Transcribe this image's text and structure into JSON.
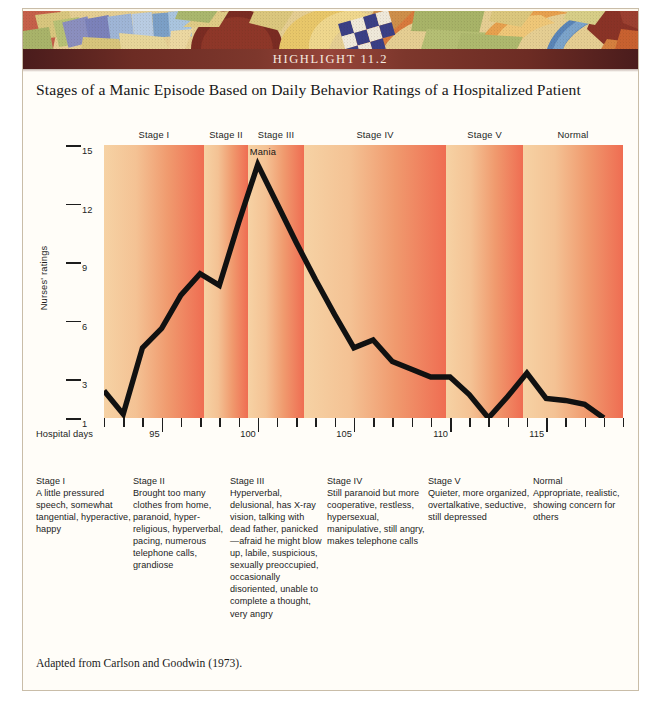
{
  "banner": {
    "label": "HIGHLIGHT 11.2"
  },
  "title": {
    "text": "Stages of a Manic Episode Based on Daily Behavior Ratings of a Hospitalized Patient"
  },
  "footnote": {
    "text": "Adapted from Carlson and Goodwin (1973)."
  },
  "annotations": {
    "mania": "Mania"
  },
  "colors": {
    "banner_dark": "#4a1c1c",
    "banner_mid": "#96453a",
    "band_light": "#f6d2a4",
    "band_dark": "#ef6d52",
    "line": "#111111",
    "frame": "#c9bda8"
  },
  "chart_data": {
    "type": "line",
    "title": "Stages of a Manic Episode Based on Daily Behavior Ratings of a Hospitalized Patient",
    "xlabel": "Hospital days",
    "ylabel": "Nurses' ratings",
    "xlim": [
      92,
      119
    ],
    "ylim": [
      1,
      15
    ],
    "grid": false,
    "legend": null,
    "ytick_labels": [
      "15",
      "12",
      "9",
      "6",
      "3",
      "1"
    ],
    "yticks": [
      15,
      12,
      9,
      6,
      3,
      1
    ],
    "xtick_labels": [
      "95",
      "100",
      "105",
      "110",
      "115"
    ],
    "xticks_major": [
      95,
      100,
      105,
      110,
      115
    ],
    "xticks_all": [
      92,
      93,
      94,
      95,
      96,
      97,
      98,
      99,
      100,
      101,
      102,
      103,
      104,
      105,
      106,
      107,
      108,
      109,
      110,
      111,
      112,
      113,
      114,
      115,
      116,
      117,
      118,
      119
    ],
    "x": [
      92,
      93,
      94,
      95,
      96,
      97,
      98,
      99,
      100,
      101,
      102,
      103,
      104,
      105,
      106,
      107,
      108,
      109,
      110,
      111,
      112,
      113,
      114,
      115,
      116,
      117,
      118
    ],
    "values": [
      2.4,
      1.2,
      4.6,
      5.6,
      7.3,
      8.4,
      7.8,
      11.0,
      14.0,
      12.0,
      10.0,
      8.1,
      6.3,
      4.6,
      5.0,
      3.9,
      3.5,
      3.1,
      3.1,
      2.2,
      1.0,
      2.1,
      3.3,
      2.0,
      1.9,
      1.7,
      1.0
    ],
    "series": [
      {
        "name": "Nurses' ratings",
        "values": [
          2.4,
          1.2,
          4.6,
          5.6,
          7.3,
          8.4,
          7.8,
          11.0,
          14.0,
          12.0,
          10.0,
          8.1,
          6.3,
          4.6,
          5.0,
          3.9,
          3.5,
          3.1,
          3.1,
          2.2,
          1.0,
          2.1,
          3.3,
          2.0,
          1.9,
          1.7,
          1.0
        ]
      }
    ],
    "annotations": [
      {
        "label": "Mania",
        "x": 100,
        "y": 14.0
      }
    ],
    "bands": [
      {
        "label": "Stage I",
        "x_start": 92,
        "x_end": 97.2
      },
      {
        "label": "Stage II",
        "x_start": 97.2,
        "x_end": 99.5
      },
      {
        "label": "Stage III",
        "x_start": 99.5,
        "x_end": 102.4
      },
      {
        "label": "Stage IV",
        "x_start": 102.4,
        "x_end": 109.8
      },
      {
        "label": "Stage V",
        "x_start": 109.8,
        "x_end": 113.8
      },
      {
        "label": "Normal",
        "x_start": 113.8,
        "x_end": 119
      }
    ]
  },
  "stage_headers": [
    {
      "label": "Stage I"
    },
    {
      "label": "Stage II"
    },
    {
      "label": "Stage III"
    },
    {
      "label": "Stage IV"
    },
    {
      "label": "Stage V"
    },
    {
      "label": "Normal"
    }
  ],
  "captions": [
    {
      "heading": "Stage I",
      "body": "A little pressured speech, somewhat tangential, hyperactive, happy"
    },
    {
      "heading": "Stage II",
      "body": "Brought too many clothes from home, paranoid, hyper-religious, hyperverbal, pacing, numerous telephone calls, grandiose"
    },
    {
      "heading": "Stage III",
      "body": "Hyperverbal, delusional, has X-ray vision, talking with dead father, panicked—afraid he might blow up, labile, suspicious, sexually preoccupied, occasionally disoriented, unable to complete a thought, very angry"
    },
    {
      "heading": "Stage IV",
      "body": "Still paranoid but more cooperative, restless, hypersexual, manipulative, still angry, makes telephone calls"
    },
    {
      "heading": "Stage V",
      "body": "Quieter, more organized, overtalkative, seductive, still depressed"
    },
    {
      "heading": "Normal",
      "body": "Appropriate, realistic, showing concern for others"
    }
  ]
}
